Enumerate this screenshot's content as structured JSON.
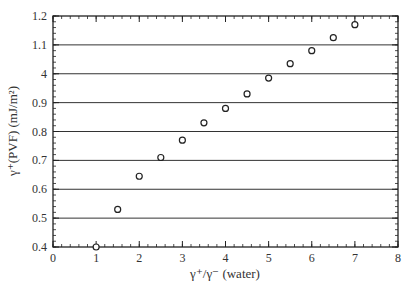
{
  "chart_data": {
    "type": "scatter",
    "title": "",
    "xlabel": "γ⁺/γ⁻ (water)",
    "ylabel": "γ⁺(PVF) (mJ/m²)",
    "xlim": [
      0,
      8
    ],
    "ylim": [
      0.4,
      1.2
    ],
    "x_ticks": [
      "0",
      "1",
      "2",
      "3",
      "4",
      "5",
      "6",
      "7",
      "8"
    ],
    "y_ticks": [
      "0.4",
      "0.5",
      "0.6",
      "0.7",
      "0.8",
      "0.9",
      "4",
      "1.1",
      "1.2"
    ],
    "grid": "horizontal",
    "legend": null,
    "series": [
      {
        "name": "PVF",
        "marker": "open-circle",
        "x": [
          1.0,
          1.5,
          2.0,
          2.5,
          3.0,
          3.5,
          4.0,
          4.5,
          5.0,
          5.5,
          6.0,
          6.5,
          7.0
        ],
        "y": [
          0.4,
          0.53,
          0.645,
          0.71,
          0.77,
          0.83,
          0.88,
          0.93,
          0.985,
          1.035,
          1.08,
          1.125,
          1.17
        ]
      }
    ]
  }
}
